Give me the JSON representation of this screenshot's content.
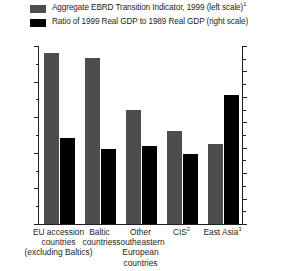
{
  "legend": {
    "items": [
      {
        "label": "Aggregate EBRD Transition Indicator, 1999 (left scale)",
        "note": "1",
        "color": "#4d4d4d",
        "icon": "legend-swatch-gray"
      },
      {
        "label": "Ratio of 1999 Real GDP to 1989 Real GDP (right scale)",
        "note": "",
        "color": "#000000",
        "icon": "legend-swatch-black"
      }
    ]
  },
  "axes": {
    "left": {
      "labels": [
        "3.5",
        "3.0",
        "2.5",
        "2.0",
        "1.5",
        "1.0"
      ],
      "min": 1.0,
      "max": 3.5,
      "minor_step": 0.25
    },
    "right": {
      "labels": [
        "3.5",
        "3.0",
        "2.5",
        "2.0",
        "1.5",
        "1.0",
        "0.5",
        "0"
      ],
      "min": 0.0,
      "max": 3.5,
      "minor_step": 0.25
    }
  },
  "categories": [
    {
      "lines": [
        "EU accession",
        "countries",
        "(excluding Baltics)"
      ],
      "note": ""
    },
    {
      "lines": [
        "Baltic",
        "countries"
      ],
      "note": ""
    },
    {
      "lines": [
        "Other",
        "southeastern",
        "European",
        "countries"
      ],
      "note": ""
    },
    {
      "lines": [
        "CIS"
      ],
      "note": "2"
    },
    {
      "lines": [
        "East Asia"
      ],
      "note": "3"
    }
  ],
  "chart_data": {
    "type": "bar",
    "title": "",
    "xlabel": "",
    "ylabel": "",
    "categories": [
      "EU accession countries (excluding Baltics)",
      "Baltic countries",
      "Other southeastern European countries",
      "CIS",
      "East Asia"
    ],
    "series": [
      {
        "name": "Aggregate EBRD Transition Indicator, 1999 (left scale)",
        "axis": "left",
        "color": "#4d4d4d",
        "values": [
          3.4,
          3.33,
          2.6,
          2.3,
          2.12
        ]
      },
      {
        "name": "Ratio of 1999 Real GDP to 1989 Real GDP (right scale)",
        "axis": "right",
        "color": "#000000",
        "values": [
          1.69,
          1.47,
          1.53,
          1.37,
          2.54
        ]
      }
    ],
    "ylim": [
      1.0,
      3.5
    ],
    "ylim_right": [
      0.0,
      3.5
    ],
    "grid": false,
    "legend_position": "top"
  },
  "footnotes": {
    "marker_1": "1",
    "marker_2": "2",
    "marker_3": "3"
  }
}
